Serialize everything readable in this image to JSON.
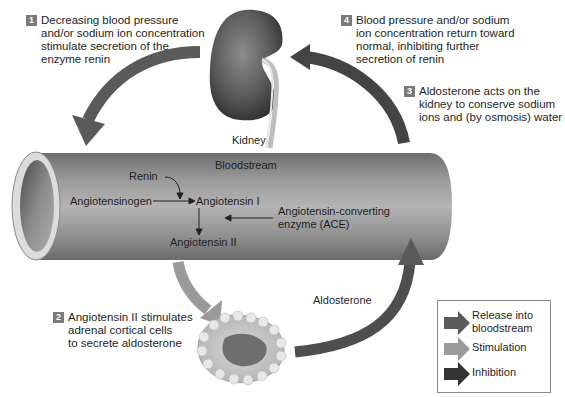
{
  "steps": [
    {
      "number": "1",
      "lines": [
        "Decreasing blood pressure",
        "and/or sodium ion concentration",
        "stimulate secretion of the",
        "enzyme renin"
      ]
    },
    {
      "number": "2",
      "lines": [
        "Angiotensin II stimulates",
        "adrenal cortical cells",
        "to secrete aldosterone"
      ]
    },
    {
      "number": "3",
      "lines": [
        "Aldosterone acts on the",
        "kidney to conserve sodium",
        "ions and (by osmosis) water"
      ]
    },
    {
      "number": "4",
      "lines": [
        "Blood pressure and/or sodium",
        "ion concentration return toward",
        "normal, inhibiting further",
        "secretion of renin"
      ]
    }
  ],
  "labels": {
    "kidney": "Kidney",
    "bloodstream": "Bloodstream",
    "renin": "Renin",
    "angiotensinogen": "Angiotensinogen",
    "angiotensin_1": "Angiotensin I",
    "angiotensin_2": "Angiotensin II",
    "ace_line1": "Angiotensin-converting",
    "ace_line2": "enzyme (ACE)",
    "aldosterone": "Aldosterone"
  },
  "legend": {
    "items": [
      {
        "label_line1": "Release into",
        "label_line2": "bloodstream",
        "color": "#5a5a5a"
      },
      {
        "label_line1": "Stimulation",
        "label_line2": "",
        "color": "#9a9a9a"
      },
      {
        "label_line1": "Inhibition",
        "label_line2": "",
        "color": "#333333"
      }
    ]
  },
  "colors": {
    "release": "#5a5a5a",
    "stimulation": "#9a9a9a",
    "inhibition": "#3a3a3a",
    "badge": "#7a7a7a"
  }
}
